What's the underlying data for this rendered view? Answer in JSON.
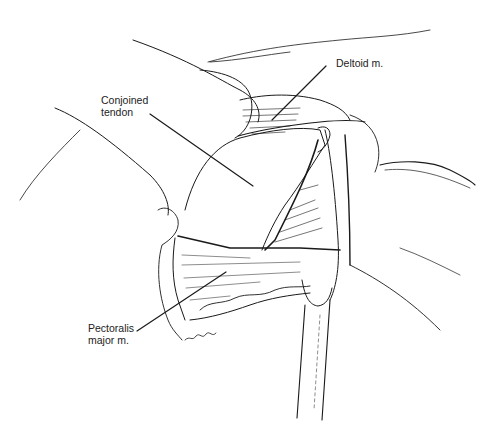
{
  "figure": {
    "type": "surgical-illustration",
    "ink_color": "#1a1a1a",
    "background": "#ffffff",
    "signature": "Hamick"
  },
  "labels": {
    "deltoid": {
      "line1": "Deltoid m."
    },
    "conjoined": {
      "line1": "Conjoined",
      "line2": "tendon"
    },
    "pectoralis": {
      "line1": "Pectoralis",
      "line2": "major m."
    }
  }
}
